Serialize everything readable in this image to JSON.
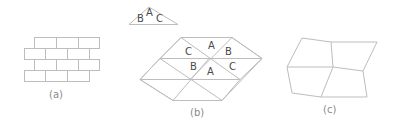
{
  "figure": {
    "panels": [
      {
        "id": "a",
        "caption": "(a)",
        "description": "brick-like staggered rectangular tiling",
        "rows": [
          {
            "y": 37,
            "x_start": 34,
            "x_end": 99,
            "dividers": [
              56,
              78
            ]
          },
          {
            "y": 48,
            "x_start": 24,
            "x_end": 89,
            "dividers": [
              45,
              67
            ]
          },
          {
            "y": 59,
            "x_start": 34,
            "x_end": 99,
            "dividers": [
              56,
              78
            ]
          },
          {
            "y": 70,
            "x_start": 24,
            "x_end": 89,
            "dividers": [
              45,
              67
            ]
          }
        ],
        "row_height": 11
      },
      {
        "id": "b",
        "caption": "(b)",
        "description": "triangular lattice with labeled corners",
        "single_triangle_labels": [
          "B",
          "A",
          "C"
        ],
        "upper_labels": [
          "C",
          "A",
          "B"
        ],
        "lower_labels": [
          "B",
          "A",
          "C"
        ]
      },
      {
        "id": "c",
        "caption": "(c)",
        "description": "irregular quadrilateral mesh of four cells"
      }
    ]
  }
}
